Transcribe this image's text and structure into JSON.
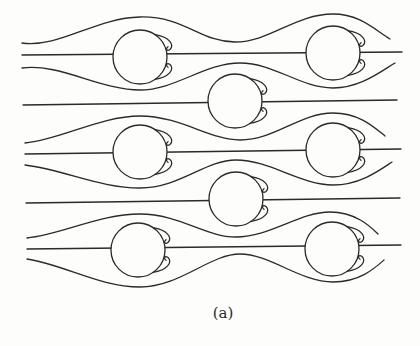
{
  "figure": {
    "caption": "(a)",
    "colors": {
      "stroke": "#2a2a2a",
      "background": "#fdfdfc"
    },
    "cylinder_radius": 27,
    "cylinders": [
      {
        "id": "c1",
        "cx": 140,
        "cy": 57
      },
      {
        "id": "c2",
        "cx": 333,
        "cy": 53
      },
      {
        "id": "c3",
        "cx": 235,
        "cy": 101
      },
      {
        "id": "c4",
        "cx": 140,
        "cy": 152
      },
      {
        "id": "c5",
        "cx": 333,
        "cy": 150
      },
      {
        "id": "c6",
        "cx": 236,
        "cy": 199
      },
      {
        "id": "c7",
        "cx": 138,
        "cy": 250
      },
      {
        "id": "c8",
        "cx": 332,
        "cy": 249
      }
    ],
    "centerlines": [
      {
        "id": "row1-center",
        "x1": 22,
        "y1": 55,
        "x2": 402,
        "y2": 52
      },
      {
        "id": "mid1-center",
        "x1": 23,
        "y1": 105,
        "x2": 397,
        "y2": 100
      },
      {
        "id": "row2-center",
        "x1": 25,
        "y1": 154,
        "x2": 401,
        "y2": 149
      },
      {
        "id": "mid2-center",
        "x1": 26,
        "y1": 203,
        "x2": 400,
        "y2": 198
      },
      {
        "id": "row3-center",
        "x1": 27,
        "y1": 249,
        "x2": 401,
        "y2": 245
      }
    ],
    "streamlines": [
      {
        "id": "row1-top",
        "d": "M22,43 C60,48 95,18 140,17 C185,16 200,42 235,42 C270,42 295,14 333,14 C360,14 375,30 390,39"
      },
      {
        "id": "row1-bottom",
        "d": "M22,68 C60,63 100,90 140,90 C175,90 205,63 240,63 C275,63 300,88 333,88 C360,88 380,72 395,63"
      },
      {
        "id": "row2-top",
        "d": "M25,143 C60,140 100,116 140,116 C180,116 210,140 240,140 C275,140 300,113 333,113 C360,113 375,128 385,136"
      },
      {
        "id": "row2-bottom",
        "d": "M25,165 C65,170 100,188 140,188 C180,188 205,160 236,160 C270,160 300,185 333,185 C360,185 380,170 392,162"
      },
      {
        "id": "row3-top",
        "d": "M27,238 C60,235 100,214 140,214 C180,214 205,237 236,237 C270,237 300,212 330,212 C355,212 370,226 378,234"
      },
      {
        "id": "row3-bottom",
        "d": "M27,259 C65,265 100,287 140,287 C180,287 210,254 240,254 C270,254 300,282 333,282 C360,282 375,268 384,260"
      }
    ]
  }
}
